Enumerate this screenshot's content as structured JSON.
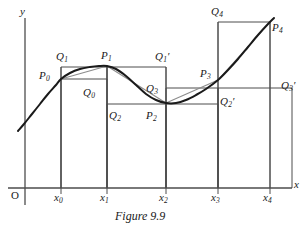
{
  "figure": {
    "caption": "Figure 9.9",
    "axis_y_label": "y",
    "axis_x_label": "x",
    "origin_label": "O",
    "colors": {
      "curve": "#1a1a1a",
      "chord": "#8c8c8c",
      "rect": "#4d4d4d",
      "axis": "#4d4d4d",
      "text": "#1a1a1a",
      "background": "#ffffff"
    }
  },
  "x_ticks": [
    {
      "label": "x",
      "sub": "0"
    },
    {
      "label": "x",
      "sub": "1"
    },
    {
      "label": "x",
      "sub": "2"
    },
    {
      "label": "x",
      "sub": "3"
    },
    {
      "label": "x",
      "sub": "4"
    }
  ],
  "point_labels": [
    {
      "name": "P0",
      "base": "P",
      "sub": "0",
      "prime": ""
    },
    {
      "name": "P1",
      "base": "P",
      "sub": "1",
      "prime": ""
    },
    {
      "name": "P2",
      "base": "P",
      "sub": "2",
      "prime": ""
    },
    {
      "name": "P3",
      "base": "P",
      "sub": "3",
      "prime": ""
    },
    {
      "name": "P4",
      "base": "P",
      "sub": "4",
      "prime": ""
    },
    {
      "name": "Q0",
      "base": "Q",
      "sub": "0",
      "prime": ""
    },
    {
      "name": "Q1",
      "base": "Q",
      "sub": "1",
      "prime": ""
    },
    {
      "name": "Q2",
      "base": "Q",
      "sub": "2",
      "prime": ""
    },
    {
      "name": "Q3",
      "base": "Q",
      "sub": "3",
      "prime": ""
    },
    {
      "name": "Q4",
      "base": "Q",
      "sub": "4",
      "prime": ""
    },
    {
      "name": "Q1p",
      "base": "Q",
      "sub": "1",
      "prime": "′"
    },
    {
      "name": "Q2p",
      "base": "Q",
      "sub": "2",
      "prime": "′"
    },
    {
      "name": "Q3p",
      "base": "Q",
      "sub": "3",
      "prime": "′"
    }
  ],
  "chart_data": {
    "type": "line",
    "title": "Figure 9.9",
    "xlabel": "x",
    "ylabel": "y",
    "grid": false,
    "legend": null,
    "xlim": [
      0,
      5.5
    ],
    "ylim": [
      0,
      5.2
    ],
    "partition_x": [
      1.0,
      2.4,
      3.9,
      5.3,
      6.7
    ],
    "partition_tick_labels": [
      "x0",
      "x1",
      "x2",
      "x3",
      "x4"
    ],
    "curve_points_px": [
      [
        18,
        131
      ],
      [
        24,
        124
      ],
      [
        32,
        114
      ],
      [
        40,
        104
      ],
      [
        48,
        94
      ],
      [
        56,
        85
      ],
      [
        61,
        79
      ],
      [
        70,
        73
      ],
      [
        80,
        69
      ],
      [
        90,
        67
      ],
      [
        99,
        66
      ],
      [
        107,
        66
      ],
      [
        116,
        69
      ],
      [
        126,
        76
      ],
      [
        136,
        85
      ],
      [
        146,
        94
      ],
      [
        156,
        100
      ],
      [
        166,
        103
      ],
      [
        176,
        103
      ],
      [
        186,
        100
      ],
      [
        196,
        95
      ],
      [
        206,
        89
      ],
      [
        218,
        80
      ],
      [
        228,
        70
      ],
      [
        238,
        59
      ],
      [
        248,
        47
      ],
      [
        258,
        35
      ],
      [
        268,
        24
      ],
      [
        274,
        18
      ]
    ],
    "curve_nodes": [
      {
        "name": "P0",
        "x_px": 61,
        "y_px": 79,
        "x_index": 0
      },
      {
        "name": "P1",
        "x_px": 107,
        "y_px": 66,
        "x_index": 1
      },
      {
        "name": "P2",
        "x_px": 166,
        "y_px": 103,
        "x_index": 2
      },
      {
        "name": "P3",
        "x_px": 218,
        "y_px": 80,
        "x_index": 3
      },
      {
        "name": "P4",
        "x_px": 270,
        "y_px": 22,
        "x_index": 4
      }
    ],
    "rectangles": [
      {
        "name": "Q1",
        "x_left_px": 61,
        "x_right_px": 107,
        "top_y_px": 67,
        "bottom_y_px": 188,
        "kind": "circumscribed"
      },
      {
        "name": "Q0",
        "x_left_px": 61,
        "x_right_px": 107,
        "top_y_px": 79,
        "bottom_y_px": 188,
        "kind": "inscribed"
      },
      {
        "name": "Q1p",
        "x_left_px": 107,
        "x_right_px": 166,
        "top_y_px": 67,
        "bottom_y_px": 188,
        "kind": "circumscribed"
      },
      {
        "name": "Q2",
        "x_left_px": 107,
        "x_right_px": 166,
        "top_y_px": 104,
        "bottom_y_px": 188,
        "kind": "inscribed"
      },
      {
        "name": "Q3",
        "x_left_px": 166,
        "x_right_px": 218,
        "top_y_px": 88,
        "bottom_y_px": 188,
        "kind": "circumscribed"
      },
      {
        "name": "Q2p",
        "x_left_px": 166,
        "x_right_px": 218,
        "top_y_px": 104,
        "bottom_y_px": 188,
        "kind": "inscribed"
      },
      {
        "name": "Q4",
        "x_left_px": 218,
        "x_right_px": 270,
        "top_y_px": 22,
        "bottom_y_px": 188,
        "kind": "circumscribed"
      },
      {
        "name": "Q3p",
        "x_left_px": 218,
        "x_right_px": 292,
        "top_y_px": 88,
        "bottom_y_px": 188,
        "kind": "inscribed"
      }
    ],
    "chords": [
      {
        "from": "P0",
        "to": "P1",
        "x1_px": 61,
        "y1_px": 79,
        "x2_px": 107,
        "y2_px": 66
      },
      {
        "from": "P1",
        "to": "P2",
        "x1_px": 107,
        "y1_px": 66,
        "x2_px": 166,
        "y2_px": 103
      },
      {
        "from": "P2",
        "to": "P3",
        "x1_px": 166,
        "y1_px": 103,
        "x2_px": 218,
        "y2_px": 80
      },
      {
        "from": "P3",
        "to": "P4",
        "x1_px": 218,
        "y1_px": 80,
        "x2_px": 270,
        "y2_px": 22
      }
    ],
    "axes_px": {
      "y_axis_x": 25,
      "y_axis_top": 18,
      "y_axis_bottom": 205,
      "x_axis_y": 188,
      "x_axis_left": 8,
      "x_axis_right": 292
    }
  }
}
